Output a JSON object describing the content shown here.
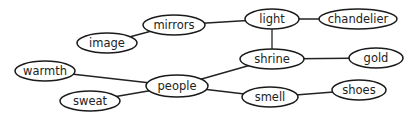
{
  "diagram": {
    "type": "concept-map",
    "colors": {
      "stroke": "#1a1a1a",
      "text": "#222222",
      "background": "#ffffff"
    },
    "nodes": [
      {
        "id": "mirrors",
        "label": "mirrors",
        "cx": 174,
        "cy": 25,
        "rx": 31,
        "ry": 10
      },
      {
        "id": "light",
        "label": "light",
        "cx": 272,
        "cy": 19,
        "rx": 27,
        "ry": 10
      },
      {
        "id": "chandelier",
        "label": "chandelier",
        "cx": 358,
        "cy": 19,
        "rx": 39,
        "ry": 10
      },
      {
        "id": "image",
        "label": "image",
        "cx": 107,
        "cy": 43,
        "rx": 30,
        "ry": 10
      },
      {
        "id": "shrine",
        "label": "shrine",
        "cx": 272,
        "cy": 59,
        "rx": 32,
        "ry": 10
      },
      {
        "id": "gold",
        "label": "gold",
        "cx": 376,
        "cy": 58,
        "rx": 27,
        "ry": 10
      },
      {
        "id": "warmth",
        "label": "warmth",
        "cx": 45,
        "cy": 71,
        "rx": 30,
        "ry": 10
      },
      {
        "id": "people",
        "label": "people",
        "cx": 177,
        "cy": 86,
        "rx": 31,
        "ry": 11
      },
      {
        "id": "sweat",
        "label": "sweat",
        "cx": 90,
        "cy": 101,
        "rx": 30,
        "ry": 10
      },
      {
        "id": "smell",
        "label": "smell",
        "cx": 270,
        "cy": 97,
        "rx": 28,
        "ry": 10
      },
      {
        "id": "shoes",
        "label": "shoes",
        "cx": 359,
        "cy": 90,
        "rx": 27,
        "ry": 10
      }
    ],
    "edges": [
      {
        "from": "image",
        "to": "mirrors"
      },
      {
        "from": "mirrors",
        "to": "light"
      },
      {
        "from": "light",
        "to": "chandelier"
      },
      {
        "from": "light",
        "to": "shrine"
      },
      {
        "from": "shrine",
        "to": "gold"
      },
      {
        "from": "people",
        "to": "shrine"
      },
      {
        "from": "warmth",
        "to": "people"
      },
      {
        "from": "sweat",
        "to": "people"
      },
      {
        "from": "people",
        "to": "smell"
      },
      {
        "from": "smell",
        "to": "shoes"
      }
    ]
  }
}
